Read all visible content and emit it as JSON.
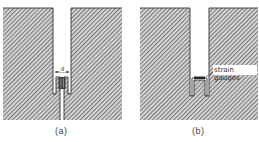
{
  "figure": {
    "panels": [
      {
        "id": "a",
        "caption": "(a)",
        "dimension_label": "d",
        "description": "Slot cut into hatched block with narrow inner channel and inserted gauge element; slit continues below"
      },
      {
        "id": "b",
        "caption": "(b)",
        "callout_label": "strain gauges",
        "description": "Slot cut into hatched block with U-shaped insert carrying strain gauges on top"
      }
    ]
  },
  "colors": {
    "hatch_fg": "#6b6b6b",
    "hatch_bg": "#d9d9d9",
    "outline": "#333333",
    "gauge": "#2a2a2a"
  }
}
